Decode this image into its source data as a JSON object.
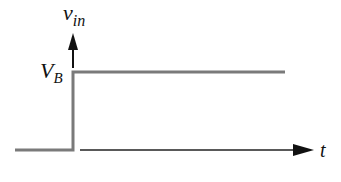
{
  "diagram": {
    "labels": {
      "y_axis_main": "v",
      "y_axis_sub": "in",
      "level_main": "V",
      "level_sub": "B",
      "x_axis": "t"
    },
    "colors": {
      "signal": "#7a7a7a",
      "axis": "#111111"
    },
    "signal": {
      "type": "step",
      "low_level": 0,
      "high_level": "V_B",
      "step_time": 0
    }
  }
}
